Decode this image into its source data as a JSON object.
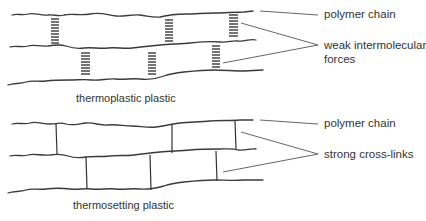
{
  "diagrams": [
    {
      "id": "thermoplastic",
      "caption": "thermoplastic plastic",
      "labels": {
        "chain": "polymer chain",
        "bond_line1": "weak intermolecular",
        "bond_line2": "forces"
      },
      "bond_type": "weak-dashed"
    },
    {
      "id": "thermosetting",
      "caption": "thermosetting plastic",
      "labels": {
        "chain": "polymer chain",
        "bond_line1": "strong cross-links"
      },
      "bond_type": "solid-crosslink"
    }
  ],
  "colors": {
    "line": "#3a3a3a",
    "text": "#333333",
    "background": "#ffffff"
  }
}
